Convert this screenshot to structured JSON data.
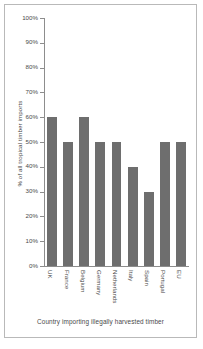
{
  "chart_data": {
    "type": "bar",
    "title": "",
    "xlabel": "Country importing illegally harvested timber",
    "ylabel": "% of all tropical timber imports",
    "categories": [
      "UK",
      "France",
      "Belgium",
      "Germany",
      "Netherlands",
      "Italy",
      "Spain",
      "Portugal",
      "EU"
    ],
    "values": [
      60,
      50,
      60,
      50,
      50,
      40,
      30,
      50,
      50
    ],
    "ylim": [
      0,
      100
    ],
    "ytick_labels": [
      "100%",
      "90%",
      "80%",
      "70%",
      "60%",
      "50%",
      "40%",
      "30%",
      "20%",
      "10%",
      "0%"
    ],
    "ytick_values": [
      100,
      90,
      80,
      70,
      60,
      50,
      40,
      30,
      20,
      10,
      0
    ],
    "grid": false,
    "legend": false,
    "bar_color": "#6e6e6e",
    "axis_color": "#8d8d8d",
    "text_color": "#4a4a4a",
    "frame_color": "#b9b9b9",
    "background": "#ffffff"
  }
}
